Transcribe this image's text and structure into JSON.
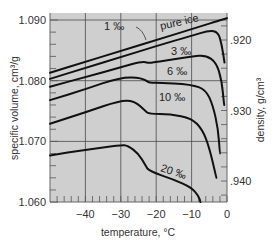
{
  "chart_data": {
    "type": "line",
    "title": "",
    "xlabel": "temperature, °C",
    "ylabel": "specific volume, cm³/g",
    "y2label": "density, g/cm³",
    "xlim": [
      -50,
      0
    ],
    "ylim": [
      1.06,
      1.091
    ],
    "x_ticks": [
      -40,
      -30,
      -20,
      -10,
      0
    ],
    "x_tick_labels": [
      "−40",
      "−30",
      "−20",
      "−10",
      "0"
    ],
    "y_ticks": [
      1.06,
      1.07,
      1.08,
      1.09
    ],
    "y_tick_labels": [
      "1.060",
      "1.070",
      "1.080",
      "1.090"
    ],
    "y2_ticks": [
      0.92,
      0.93,
      0.94
    ],
    "y2_tick_labels": [
      ".920",
      ".930",
      ".940"
    ],
    "grid": true,
    "legend": "inline labels on curves",
    "series": [
      {
        "name": "pure ice",
        "label": "pure ice",
        "x": [
          -50,
          -40,
          -30,
          -20,
          -10,
          0
        ],
        "values": [
          1.0813,
          1.0831,
          1.0849,
          1.0867,
          1.0885,
          1.0903
        ]
      },
      {
        "name": "1 ‰",
        "label": "1 ‰",
        "x": [
          -50,
          -40,
          -30,
          -20,
          -10,
          -5,
          -2.5,
          -1.5,
          -0.7
        ],
        "values": [
          1.0803,
          1.0821,
          1.0839,
          1.0857,
          1.0874,
          1.0883,
          1.088,
          1.086,
          1.083
        ]
      },
      {
        "name": "3 ‰",
        "label": "3 ‰",
        "x": [
          -50,
          -40,
          -30,
          -24,
          -22,
          -20,
          -10,
          -6,
          -3,
          -1.5,
          -0.8
        ],
        "values": [
          1.079,
          1.0806,
          1.0822,
          1.0832,
          1.0829,
          1.0831,
          1.084,
          1.0842,
          1.083,
          1.08,
          1.076
        ]
      },
      {
        "name": "6 ‰",
        "label": "6 ‰",
        "x": [
          -50,
          -40,
          -30,
          -24,
          -22,
          -20,
          -10,
          -6,
          -4,
          -2.5,
          -2
        ],
        "values": [
          1.0768,
          1.0786,
          1.0806,
          1.0805,
          1.0796,
          1.0797,
          1.0794,
          1.0785,
          1.076,
          1.072,
          1.068
        ]
      },
      {
        "name": "10 ‰",
        "label": "10 ‰",
        "x": [
          -50,
          -40,
          -30,
          -26,
          -23,
          -22,
          -16,
          -10,
          -7,
          -5,
          -3
        ],
        "values": [
          1.0729,
          1.0748,
          1.0768,
          1.0766,
          1.075,
          1.0745,
          1.0745,
          1.0738,
          1.072,
          1.069,
          1.064
        ]
      },
      {
        "name": "20 ‰",
        "label": "20 ‰",
        "x": [
          -50,
          -40,
          -30,
          -28,
          -25,
          -23,
          -22,
          -15,
          -10,
          -8,
          -7.5
        ],
        "values": [
          1.0677,
          1.0686,
          1.0694,
          1.0693,
          1.068,
          1.066,
          1.0651,
          1.0637,
          1.0624,
          1.061,
          1.06
        ]
      }
    ]
  },
  "colors": {
    "plot_background": "#cfcfcf",
    "grid": "#4a4a4a",
    "curve": "#111111",
    "text": "#333333"
  }
}
